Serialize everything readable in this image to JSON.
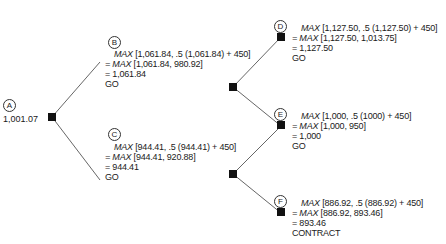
{
  "diagram": {
    "type": "decision-tree",
    "nodes": [
      {
        "id": "A",
        "label": "A",
        "value": "1,001.07",
        "x": 25,
        "y": 145
      },
      {
        "id": "B",
        "label": "B",
        "x": 99,
        "y": 65,
        "lines": {
          "fn1": "MAX",
          "arg1": "[1,061.84, .5 (1,061.84) + 450]",
          "fn2": "= MAX",
          "arg2": "[1,061.84, 980.92]",
          "result": "= 1,061.84",
          "decision": "GO"
        }
      },
      {
        "id": "C",
        "label": "C",
        "x": 99,
        "y": 183,
        "lines": {
          "fn1": "MAX",
          "arg1": "[944.41, .5 (944.41) + 450]",
          "fn2": "= MAX",
          "arg2": "[944.41, 920.88]",
          "result": "= 944.41",
          "decision": "GO"
        }
      },
      {
        "id": "BC",
        "label": "",
        "x": 232,
        "y": 86
      },
      {
        "id": "CD",
        "label": "",
        "x": 232,
        "y": 174
      },
      {
        "id": "D",
        "label": "D",
        "x": 280,
        "y": 36,
        "lines": {
          "fn1": "MAX",
          "arg1": "[1,127.50, .5 (1,127.50) + 450]",
          "fn2": "= MAX",
          "arg2": "[1,127.50, 1,013.75]",
          "result": "= 1,127.50",
          "decision": "GO"
        }
      },
      {
        "id": "E",
        "label": "E",
        "x": 280,
        "y": 124,
        "lines": {
          "fn1": "MAX",
          "arg1": "[1,000, .5 (1000) + 450]",
          "fn2": "= MAX",
          "arg2": "[1,000, 950]",
          "result": "= 1,000",
          "decision": "GO"
        }
      },
      {
        "id": "F",
        "label": "F",
        "x": 280,
        "y": 211,
        "lines": {
          "fn1": "MAX",
          "arg1": "[886.92, .5 (886.92) + 450]",
          "fn2": "= MAX",
          "arg2": "[886.92, 893.46]",
          "result": "= 893.46",
          "decision": "CONTRACT"
        }
      }
    ],
    "edges": [
      [
        "A",
        "BC"
      ],
      [
        "A",
        "CD"
      ],
      [
        "BC",
        "D"
      ],
      [
        "BC",
        "E"
      ],
      [
        "CD",
        "E"
      ],
      [
        "CD",
        "F"
      ]
    ]
  }
}
